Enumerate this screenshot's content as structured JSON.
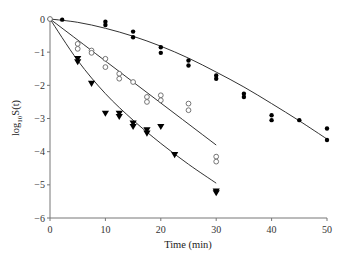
{
  "chart_data": {
    "type": "scatter",
    "title": "",
    "xlabel": "Time (min)",
    "ylabel": "log10S(t)",
    "ylabel_parts": {
      "prefix": "log",
      "sub": "10",
      "suffix": "S(t)"
    },
    "xlim": [
      0,
      50
    ],
    "ylim": [
      -6,
      0
    ],
    "xticks": [
      0,
      10,
      20,
      30,
      40,
      50
    ],
    "yticks": [
      0,
      -1,
      -2,
      -3,
      -4,
      -5,
      -6
    ],
    "grid": false,
    "legend": null,
    "series": [
      {
        "name": "filled circles",
        "marker": "filled-circle",
        "color": "#000000",
        "points": [
          [
            0,
            0
          ],
          [
            2.2,
            -0.02
          ],
          [
            10,
            -0.08
          ],
          [
            10,
            -0.18
          ],
          [
            15,
            -0.38
          ],
          [
            15,
            -0.55
          ],
          [
            20,
            -0.85
          ],
          [
            20,
            -1.02
          ],
          [
            25,
            -1.25
          ],
          [
            25,
            -1.4
          ],
          [
            30,
            -1.7
          ],
          [
            30,
            -1.8
          ],
          [
            35,
            -2.25
          ],
          [
            35,
            -2.35
          ],
          [
            40,
            -2.9
          ],
          [
            40,
            -3.05
          ],
          [
            45,
            -3.05
          ],
          [
            50,
            -3.3
          ],
          [
            50,
            -3.65
          ]
        ],
        "fit_curve": [
          [
            0,
            0
          ],
          [
            5,
            -0.1
          ],
          [
            10,
            -0.28
          ],
          [
            15,
            -0.52
          ],
          [
            20,
            -0.82
          ],
          [
            25,
            -1.18
          ],
          [
            30,
            -1.6
          ],
          [
            35,
            -2.05
          ],
          [
            40,
            -2.55
          ],
          [
            45,
            -3.07
          ],
          [
            50,
            -3.62
          ]
        ]
      },
      {
        "name": "open circles",
        "marker": "open-circle",
        "color": "#555555",
        "points": [
          [
            0,
            0
          ],
          [
            5,
            -0.75
          ],
          [
            5,
            -0.9
          ],
          [
            7.5,
            -0.95
          ],
          [
            7.5,
            -1.02
          ],
          [
            10,
            -1.2
          ],
          [
            10,
            -1.45
          ],
          [
            12.5,
            -1.65
          ],
          [
            12.5,
            -1.8
          ],
          [
            15,
            -1.9
          ],
          [
            17.5,
            -2.35
          ],
          [
            17.5,
            -2.5
          ],
          [
            20,
            -2.3
          ],
          [
            20,
            -2.45
          ],
          [
            25,
            -2.55
          ],
          [
            25,
            -2.75
          ],
          [
            30,
            -4.15
          ],
          [
            30,
            -4.3
          ]
        ],
        "fit_curve": [
          [
            0,
            0
          ],
          [
            30,
            -3.8
          ]
        ]
      },
      {
        "name": "filled triangles",
        "marker": "filled-triangle-down",
        "color": "#000000",
        "points": [
          [
            5,
            -1.2
          ],
          [
            5,
            -1.3
          ],
          [
            7.5,
            -1.95
          ],
          [
            10,
            -2.85
          ],
          [
            12.5,
            -2.85
          ],
          [
            12.5,
            -2.95
          ],
          [
            15,
            -3.15
          ],
          [
            15,
            -3.25
          ],
          [
            17.5,
            -3.35
          ],
          [
            17.5,
            -3.45
          ],
          [
            20,
            -3.25
          ],
          [
            22.5,
            -4.1
          ],
          [
            30,
            -5.2
          ],
          [
            30,
            -5.25
          ]
        ],
        "fit_curve": [
          [
            0,
            0
          ],
          [
            5,
            -1.25
          ],
          [
            10,
            -2.25
          ],
          [
            15,
            -3.05
          ],
          [
            20,
            -3.75
          ],
          [
            25,
            -4.38
          ],
          [
            30,
            -4.95
          ]
        ]
      }
    ]
  },
  "axes": {
    "x_title": "Time (min)",
    "y_title_prefix": "log",
    "y_title_sub": "10",
    "y_title_suffix": "S(t)"
  }
}
